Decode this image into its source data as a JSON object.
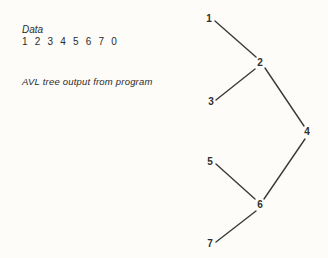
{
  "data_section": {
    "label": "Data",
    "values": "1 2 3 4 5 6 7 0"
  },
  "caption": "AVL tree output from program",
  "tree": {
    "nodes": [
      {
        "id": "1",
        "label": "1",
        "x": 209,
        "y": 19
      },
      {
        "id": "2",
        "label": "2",
        "x": 260,
        "y": 63
      },
      {
        "id": "3",
        "label": "3",
        "x": 211,
        "y": 102
      },
      {
        "id": "4",
        "label": "4",
        "x": 307,
        "y": 132
      },
      {
        "id": "5",
        "label": "5",
        "x": 210,
        "y": 162
      },
      {
        "id": "6",
        "label": "6",
        "x": 260,
        "y": 205
      },
      {
        "id": "7",
        "label": "7",
        "x": 210,
        "y": 244
      }
    ],
    "edges": [
      {
        "from": "1",
        "to": "2",
        "x1": 215,
        "y1": 21,
        "x2": 256,
        "y2": 57
      },
      {
        "from": "3",
        "to": "2",
        "x1": 216,
        "y1": 100,
        "x2": 255,
        "y2": 69
      },
      {
        "from": "2",
        "to": "4",
        "x1": 265,
        "y1": 68,
        "x2": 304,
        "y2": 126
      },
      {
        "from": "4",
        "to": "6",
        "x1": 305,
        "y1": 139,
        "x2": 264,
        "y2": 199
      },
      {
        "from": "5",
        "to": "6",
        "x1": 216,
        "y1": 164,
        "x2": 255,
        "y2": 199
      },
      {
        "from": "7",
        "to": "6",
        "x1": 216,
        "y1": 242,
        "x2": 256,
        "y2": 211
      }
    ]
  }
}
